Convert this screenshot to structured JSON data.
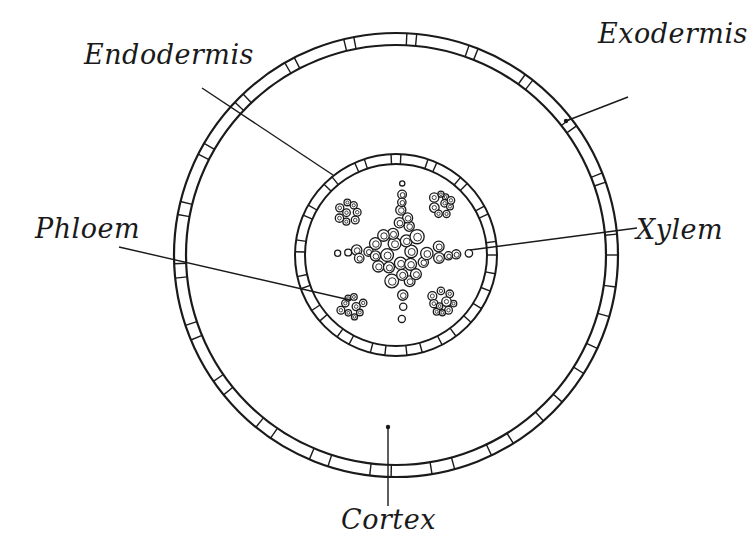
{
  "diagram": {
    "type": "biology-cross-section",
    "colors": {
      "ink": "#1a1a1a",
      "background": "#ffffff"
    },
    "geometry": {
      "center": [
        396,
        255
      ],
      "outer_ring": {
        "outer_r": 222,
        "inner_r": 210,
        "cell_divisions": 44
      },
      "inner_ring": {
        "outer_r": 101,
        "inner_r": 91,
        "cell_divisions": 34
      },
      "xylem_star": {
        "top": [
          395,
          173
        ],
        "right": [
          478,
          252
        ],
        "bottom": [
          398,
          334
        ],
        "left": [
          326,
          257
        ]
      },
      "phloem_clusters": [
        [
          349,
          211
        ],
        [
          440,
          205
        ],
        [
          352,
          306
        ],
        [
          442,
          302
        ]
      ]
    },
    "labels": [
      {
        "id": "endodermis",
        "text": "Endodermis",
        "x": 84,
        "y": 41,
        "line": [
          [
            202,
            88
          ],
          [
            333,
            175
          ]
        ]
      },
      {
        "id": "exodermis",
        "text": "Exodermis",
        "x": 598,
        "y": 20,
        "line": [
          [
            628,
            97
          ],
          [
            566,
            121
          ]
        ],
        "dot": [
          566,
          121
        ]
      },
      {
        "id": "phloem",
        "text": "Phloem",
        "x": 35,
        "y": 215,
        "line": [
          [
            119,
            247
          ],
          [
            350,
            300
          ]
        ]
      },
      {
        "id": "xylem",
        "text": "Xylem",
        "x": 636,
        "y": 216,
        "line": [
          [
            637,
            228
          ],
          [
            470,
            250
          ]
        ]
      },
      {
        "id": "cortex",
        "text": "Cortex",
        "x": 341,
        "y": 506,
        "line": [
          [
            388,
            427
          ],
          [
            388,
            506
          ]
        ],
        "dot": [
          388,
          427
        ]
      }
    ]
  }
}
